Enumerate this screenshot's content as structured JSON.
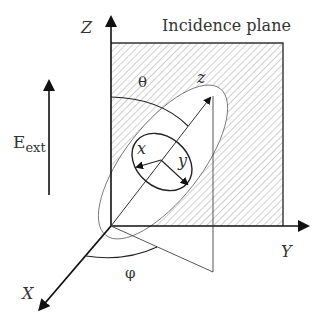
{
  "diagram": {
    "plane_label": "Incidence plane",
    "axes": {
      "lab_z": "Z",
      "lab_y": "Y",
      "lab_x": "X",
      "mol_z": "z",
      "mol_x": "x",
      "mol_y": "y"
    },
    "angles": {
      "theta": "θ",
      "phi": "φ"
    },
    "field": {
      "symbol": "E",
      "subscript": "ext"
    }
  },
  "colors": {
    "line": "#222222",
    "hatch": "#8a8a8a",
    "thin": "#555555"
  }
}
